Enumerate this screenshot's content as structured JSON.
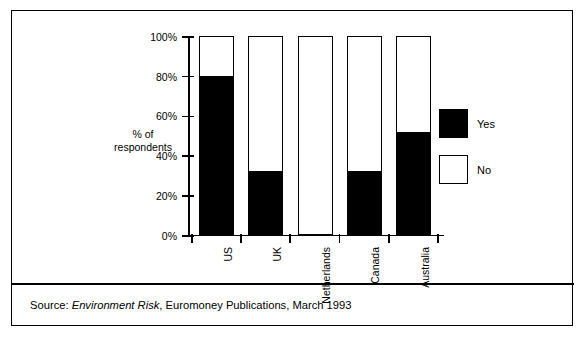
{
  "chart_data": {
    "type": "bar",
    "subtype": "stacked-bar-100-percent",
    "title": "",
    "xlabel": "",
    "ylabel": "% of respondents",
    "ylim": [
      0,
      100
    ],
    "yticks": [
      "0%",
      "20%",
      "40%",
      "60%",
      "80%",
      "100%"
    ],
    "ytick_values": [
      0,
      20,
      40,
      60,
      80,
      100
    ],
    "grid": false,
    "legend_position": "right",
    "categories": [
      "US",
      "UK",
      "Netherlands",
      "Canada",
      "Australia"
    ],
    "series": [
      {
        "name": "Yes",
        "color": "#000000",
        "values": [
          80,
          32,
          0,
          32,
          52
        ]
      },
      {
        "name": "No",
        "color": "#ffffff",
        "values": [
          20,
          68,
          100,
          68,
          48
        ]
      }
    ]
  },
  "axis": {
    "y_title_line1": "% of",
    "y_title_line2": "respondents"
  },
  "legend": {
    "items": [
      {
        "label": "Yes",
        "swatch": "filled"
      },
      {
        "label": "No",
        "swatch": "hollow"
      }
    ]
  },
  "source": {
    "prefix": "Source: ",
    "publication": "Environment Risk",
    "suffix": ", Euromoney Publications, March 1993"
  },
  "colors": {
    "ink": "#000000",
    "paper": "#ffffff"
  }
}
